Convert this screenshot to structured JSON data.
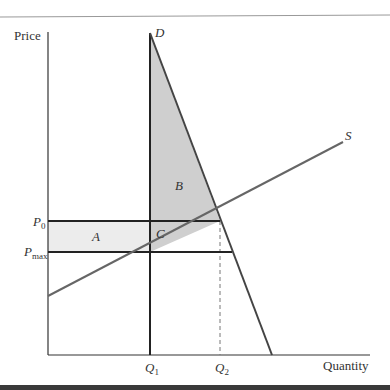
{
  "diagram": {
    "type": "price-ceiling supply-demand diagram",
    "axes": {
      "y_label": "Price",
      "x_label": "Quantity"
    },
    "curves": {
      "demand_label": "D",
      "supply_label": "S"
    },
    "price_levels": {
      "p0": {
        "base": "P",
        "sub": "0"
      },
      "pmax": {
        "base": "P",
        "sub": "max"
      }
    },
    "quantity_levels": {
      "q1": {
        "base": "Q",
        "sub": "1"
      },
      "q2": {
        "base": "Q",
        "sub": "2"
      }
    },
    "regions": {
      "a": "A",
      "b": "B",
      "c": "C"
    },
    "colors": {
      "line": "#2b2b2b",
      "curve": "#555555",
      "shade_dark": "#cfcfcf",
      "shade_light": "#ececec",
      "frame_top": "#888888",
      "frame_bottom": "#3a3a3a"
    }
  }
}
